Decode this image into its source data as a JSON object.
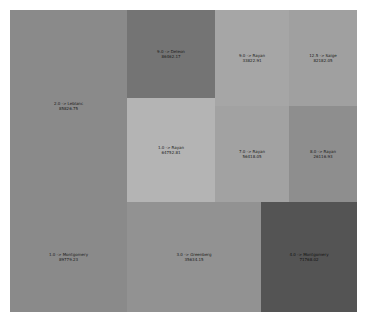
{
  "chart_data": {
    "type": "treemap",
    "title": "",
    "cells": [
      {
        "label": "2.0 -> Leblanc",
        "value": "85826.75",
        "x": 0,
        "y": 0,
        "w": 117,
        "h": 192,
        "color": "#8a8a8a"
      },
      {
        "label": "9.0 -> Deleon",
        "value": "86462.17",
        "x": 117,
        "y": 0,
        "w": 88,
        "h": 88,
        "color": "#747474"
      },
      {
        "label": "9.0 -> Rayan",
        "value": "33822.91",
        "x": 205,
        "y": 0,
        "w": 74,
        "h": 96,
        "color": "#a6a6a6"
      },
      {
        "label": "12.5 -> Saige",
        "value": "82182.05",
        "x": 279,
        "y": 0,
        "w": 68,
        "h": 96,
        "color": "#a0a0a0"
      },
      {
        "label": "1.0 -> Rayan",
        "value": "64752.81",
        "x": 117,
        "y": 88,
        "w": 88,
        "h": 104,
        "color": "#b4b4b4"
      },
      {
        "label": "7.0 -> Rayan",
        "value": "56418.05",
        "x": 205,
        "y": 96,
        "w": 74,
        "h": 96,
        "color": "#a2a2a2"
      },
      {
        "label": "8.0 -> Rayan",
        "value": "26116.93",
        "x": 279,
        "y": 96,
        "w": 68,
        "h": 96,
        "color": "#8e8e8e"
      },
      {
        "label": "1.0 -> Montgomery",
        "value": "89779.23",
        "x": 0,
        "y": 192,
        "w": 117,
        "h": 110,
        "color": "#8a8a8a"
      },
      {
        "label": "3.0 -> Greenberg",
        "value": "35634.15",
        "x": 117,
        "y": 192,
        "w": 134,
        "h": 110,
        "color": "#929292"
      },
      {
        "label": "4.0 -> Montgomery",
        "value": "71768.02",
        "x": 251,
        "y": 192,
        "w": 96,
        "h": 110,
        "color": "#545454"
      }
    ]
  }
}
